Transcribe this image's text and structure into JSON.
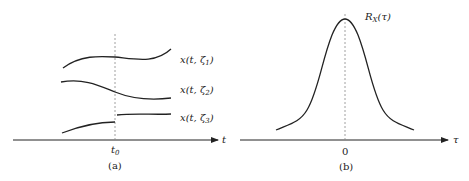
{
  "panel_a": {
    "caption": "(a)",
    "axis_label": "t",
    "tick_label_main": "t",
    "tick_label_sub": "0",
    "curves": [
      {
        "label_pre": "x(t, ",
        "label_sym": "ζ",
        "label_sub": "1",
        "label_post": ")"
      },
      {
        "label_pre": "x(t, ",
        "label_sym": "ζ",
        "label_sub": "2",
        "label_post": ")"
      },
      {
        "label_pre": "x(t, ",
        "label_sym": "ζ",
        "label_sub": "3",
        "label_post": ")"
      }
    ]
  },
  "panel_b": {
    "caption": "(b)",
    "axis_label": "τ",
    "tick_label": "0",
    "curve_label_main": "R",
    "curve_label_sub": "X",
    "curve_label_arg": "(τ)"
  },
  "colors": {
    "line": "#222222",
    "dashed": "#777777"
  }
}
